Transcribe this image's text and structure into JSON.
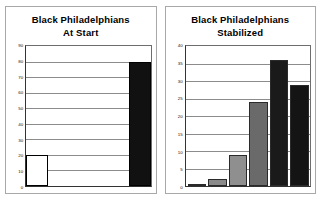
{
  "figure": {
    "background": "#ffffff",
    "panel_border_color": "#a8a8a8",
    "axis_color": "#333333",
    "gridline_color": "#8c8c8c"
  },
  "panels": [
    {
      "id": "at-start",
      "title_line1": "Black Philadelphians",
      "title_line2": "At Start"
    },
    {
      "id": "stabilized",
      "title_line1": "Black Philadelphians",
      "title_line2": "Stabilized"
    }
  ],
  "chart_data": [
    {
      "type": "bar",
      "id": "at-start",
      "title": "Black Philadelphians At Start",
      "xlabel": "",
      "ylabel": "",
      "categories": [
        "1",
        "2"
      ],
      "values": [
        20,
        80
      ],
      "colors": [
        "#ffffff",
        "#111111"
      ],
      "ylim": [
        0,
        90
      ],
      "yticks": [
        0,
        10,
        20,
        30,
        40,
        50,
        60,
        70,
        80,
        90
      ],
      "grid": true,
      "legend": "none"
    },
    {
      "type": "bar",
      "id": "stabilized",
      "title": "Black Philadelphians Stabilized",
      "xlabel": "",
      "ylabel": "",
      "categories": [
        "1",
        "2",
        "3",
        "4",
        "5",
        "6"
      ],
      "values": [
        0.5,
        2,
        9,
        24,
        36,
        29
      ],
      "colors": [
        "#6d6d6d",
        "#8a8a8a",
        "#8f8f8f",
        "#6a6a6a",
        "#1a1a1a",
        "#141414"
      ],
      "ylim": [
        0,
        40
      ],
      "yticks": [
        0,
        5,
        10,
        15,
        20,
        25,
        30,
        35,
        40
      ],
      "grid": true,
      "legend": "none"
    }
  ]
}
